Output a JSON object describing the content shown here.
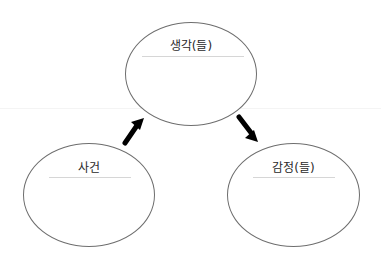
{
  "diagram": {
    "type": "cycle",
    "nodes": [
      {
        "id": "thoughts",
        "label": "생각(들)",
        "position": "top"
      },
      {
        "id": "event",
        "label": "사건",
        "position": "bottom-left"
      },
      {
        "id": "emotions",
        "label": "감정(들)",
        "position": "bottom-right"
      }
    ],
    "edges": [
      {
        "from": "event",
        "to": "thoughts",
        "style": "thick-black-arrow"
      },
      {
        "from": "thoughts",
        "to": "emotions",
        "style": "thick-black-arrow"
      }
    ],
    "colors": {
      "node_border": "#6e6e6e",
      "label_text": "#2a2a2a",
      "label_rule": "#d6d6d6",
      "arrow": "#000000",
      "background": "#ffffff"
    }
  }
}
